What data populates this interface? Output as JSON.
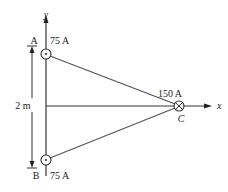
{
  "diagram": {
    "points": {
      "A": {
        "label": "A",
        "current": "75 A",
        "direction": "out-of-page"
      },
      "B": {
        "label": "B",
        "current": "75 A",
        "direction": "out-of-page"
      },
      "C": {
        "label": "C",
        "current": "150 A",
        "direction": "into-page"
      }
    },
    "axes": {
      "x": "x",
      "y": "y"
    },
    "dimension": "2 m"
  }
}
